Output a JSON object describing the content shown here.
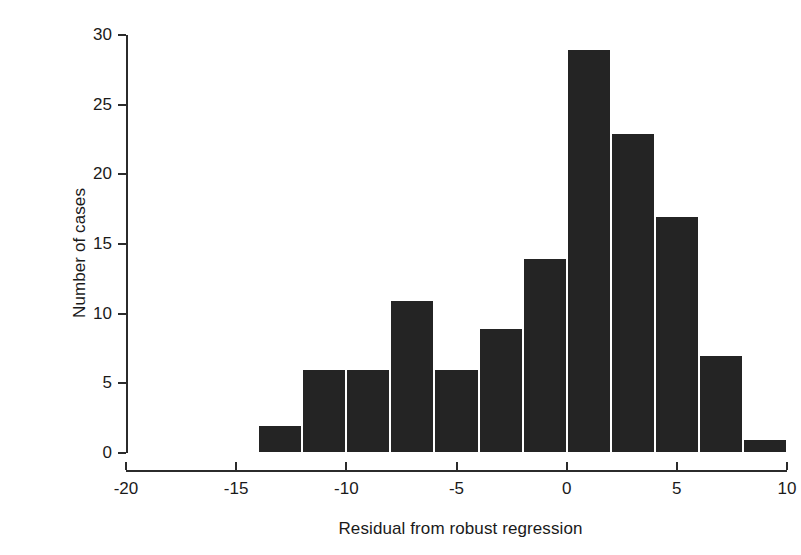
{
  "chart_data": {
    "type": "bar",
    "title": "",
    "subtitle": "",
    "xlabel": "Residual from robust regression",
    "ylabel": "Number of cases",
    "xlim": [
      -20,
      10
    ],
    "ylim": [
      0,
      30
    ],
    "grid": false,
    "legend": null,
    "bin_width": 2,
    "bin_edges": [
      -14,
      -12,
      -10,
      -8,
      -6,
      -4,
      -2,
      0,
      2,
      4,
      6,
      8,
      10
    ],
    "categories": [
      "-14 to -12",
      "-12 to -10",
      "-10 to -8",
      "-8 to -6",
      "-6 to -4",
      "-4 to -2",
      "-2 to 0",
      "0 to 2",
      "2 to 4",
      "4 to 6",
      "6 to 8",
      "8 to 10"
    ],
    "values": [
      2,
      6,
      6,
      11,
      6,
      9,
      14,
      29,
      23,
      17,
      7,
      1
    ],
    "xticks": [
      -20,
      -15,
      -10,
      -5,
      0,
      5,
      10
    ],
    "xtick_labels": [
      "-20",
      "-15",
      "-10",
      "-5",
      "0",
      "5",
      "10"
    ],
    "yticks": [
      0,
      5,
      10,
      15,
      20,
      25,
      30
    ],
    "ytick_labels": [
      "0",
      "5",
      "10",
      "15",
      "20",
      "25",
      "30"
    ],
    "bar_color": "#242424",
    "bar_edge_color": "#ffffff",
    "axis_color": "#2b2b2b",
    "background_color": "#ffffff"
  }
}
